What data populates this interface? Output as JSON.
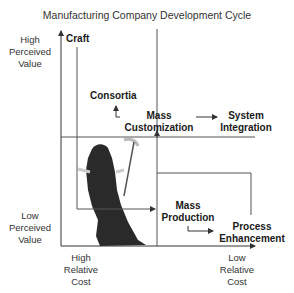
{
  "title": "Manufacturing Company Development Cycle",
  "axes": {
    "y_high": [
      "High",
      "Perceived",
      "Value"
    ],
    "y_low": [
      "Low",
      "Perceived",
      "Value"
    ],
    "x_high": [
      "High",
      "Relative",
      "Cost"
    ],
    "x_low": [
      "Low",
      "Relative",
      "Cost"
    ]
  },
  "nodes": {
    "craft": "Craft",
    "consortia": "Consortia",
    "mass_customization": [
      "Mass",
      "Customization"
    ],
    "system_integration": [
      "System",
      "Integration"
    ],
    "mass_production": [
      "Mass",
      "Production"
    ],
    "process_enhancement": [
      "Process",
      "Enhancement"
    ]
  },
  "figure": "grim-reaper-silhouette",
  "colors": {
    "line": "#444444",
    "text": "#1a1a1a",
    "figure": "#2a2a2a"
  }
}
